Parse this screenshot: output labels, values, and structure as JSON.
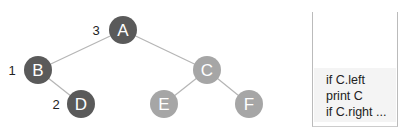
{
  "diagram": {
    "type": "binary-tree-traversal",
    "nodes": [
      {
        "id": "A",
        "label": "A",
        "order": "3",
        "cx": 123,
        "cy": 30,
        "color": "#5a5a5a"
      },
      {
        "id": "B",
        "label": "B",
        "order": "1",
        "cx": 38,
        "cy": 70,
        "color": "#5a5a5a"
      },
      {
        "id": "C",
        "label": "C",
        "order": "",
        "cx": 207,
        "cy": 70,
        "color": "#a6a6a6"
      },
      {
        "id": "D",
        "label": "D",
        "order": "2",
        "cx": 81,
        "cy": 104,
        "color": "#5a5a5a"
      },
      {
        "id": "E",
        "label": "E",
        "order": "",
        "cx": 164,
        "cy": 104,
        "color": "#a6a6a6"
      },
      {
        "id": "F",
        "label": "F",
        "order": "",
        "cx": 249,
        "cy": 104,
        "color": "#a6a6a6"
      }
    ],
    "edges": [
      [
        "A",
        "B"
      ],
      [
        "A",
        "C"
      ],
      [
        "B",
        "D"
      ],
      [
        "C",
        "E"
      ],
      [
        "C",
        "F"
      ]
    ],
    "colors": {
      "visited": "#5a5a5a",
      "unvisited": "#a6a6a6",
      "edge": "#b5b5b5"
    }
  },
  "code_box": {
    "lines": [
      "if C.left",
      "print C",
      "if C.right ..."
    ]
  }
}
